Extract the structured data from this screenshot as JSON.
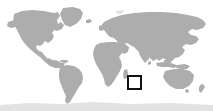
{
  "figure": {
    "type": "locator-map",
    "projection": "equirectangular-world",
    "width": 213,
    "height": 111
  },
  "colors": {
    "background": "#ffffff",
    "ocean": "#ffffff",
    "land": "#adadad",
    "land_faint": "#e2e2e2",
    "marker_stroke": "#111111",
    "marker_fill": "#ffffff"
  },
  "marker": {
    "name": "locator-box",
    "shape": "square",
    "stroke_width_px": 2,
    "x_px": 127,
    "y_px": 75,
    "width_px": 15,
    "height_px": 15,
    "region_hint": "Indian Ocean, east of Madagascar"
  },
  "landmasses": [
    {
      "name": "north-america"
    },
    {
      "name": "south-america"
    },
    {
      "name": "europe"
    },
    {
      "name": "africa"
    },
    {
      "name": "asia"
    },
    {
      "name": "australia"
    },
    {
      "name": "greenland"
    },
    {
      "name": "madagascar"
    },
    {
      "name": "new-zealand"
    },
    {
      "name": "japan"
    },
    {
      "name": "indonesia"
    },
    {
      "name": "british-isles"
    },
    {
      "name": "antarctica"
    },
    {
      "name": "iceland"
    }
  ],
  "chart_data": {
    "type": "map",
    "xlabel": "",
    "ylabel": "",
    "xlim": [
      -180,
      180
    ],
    "ylim": [
      -60,
      84
    ],
    "grid": false,
    "legend": "none",
    "series": [
      {
        "name": "land",
        "style": "filled-polygon",
        "color": "#adadad"
      },
      {
        "name": "highlight-box",
        "style": "open-rectangle",
        "color": "#111111",
        "values": [
          {
            "lon_min": 54,
            "lon_max": 80,
            "lat_min": -28,
            "lat_max": -6
          }
        ]
      }
    ]
  }
}
